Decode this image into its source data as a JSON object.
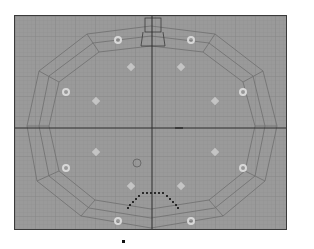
{
  "viewport": {
    "view": "Top",
    "mode": "wireframe",
    "background_color": "#9a9a9a",
    "grid_color": "#8c8c8c",
    "axis_color": "#2e2e2e",
    "mesh_line_color": "#707070",
    "marker_color": "#c8c8c8"
  },
  "scene": {
    "lamp_markers": 8,
    "diamond_markers": 10,
    "seat_row_dots": 17
  }
}
